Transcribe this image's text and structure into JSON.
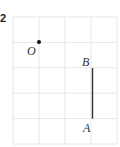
{
  "question_number": "2",
  "grid": {
    "origin_x": 13,
    "origin_y": 17,
    "cols": 4,
    "rows": 5,
    "cell_w": 26,
    "cell_h": 25.4,
    "line_color": "#e6e6e6"
  },
  "points": [
    {
      "label": "O",
      "grid_x": 1,
      "grid_y": 1,
      "dot": true
    },
    {
      "label": "B",
      "grid_x": 3,
      "grid_y": 2,
      "dot": false
    },
    {
      "label": "A",
      "grid_x": 3,
      "grid_y": 4,
      "dot": false
    }
  ],
  "segments": [
    {
      "from": "B",
      "to": "A",
      "color": "#333333"
    }
  ]
}
